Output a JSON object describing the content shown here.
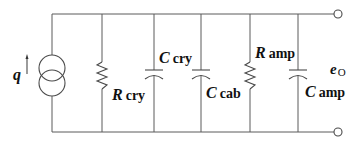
{
  "diagram": {
    "type": "circuit",
    "source": {
      "symbol": "q",
      "type": "current-source"
    },
    "components": [
      {
        "id": "r_cry",
        "type": "resistor",
        "main": "R",
        "sub": "cry"
      },
      {
        "id": "c_cry",
        "type": "capacitor",
        "main": "C",
        "sub": "cry"
      },
      {
        "id": "c_cab",
        "type": "capacitor",
        "main": "C",
        "sub": "cab"
      },
      {
        "id": "r_amp",
        "type": "resistor",
        "main": "R",
        "sub": "amp"
      },
      {
        "id": "c_amp",
        "type": "capacitor",
        "main": "C",
        "sub": "amp"
      }
    ],
    "output": {
      "main": "e",
      "sub": "O"
    }
  }
}
